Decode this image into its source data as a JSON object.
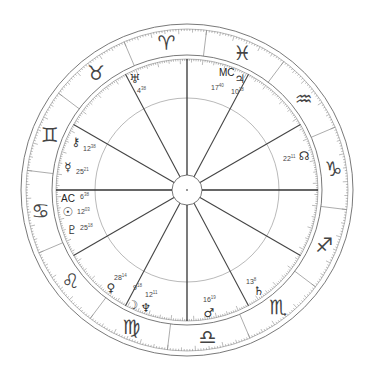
{
  "chart": {
    "center": [
      187,
      190
    ],
    "radii": {
      "outer": 166,
      "outer_inner": 161,
      "zodiac_inner": 135,
      "zodiac_inner2": 131,
      "middle": 92,
      "hub": 15
    },
    "sign_boundary_start_deg": 83,
    "house_spokes_deg": [
      0,
      30,
      62,
      90,
      118,
      150,
      180,
      210,
      242,
      270,
      298,
      330
    ],
    "axis_spokes_deg": [
      0,
      90,
      180,
      270
    ],
    "signs": [
      {
        "name": "aries",
        "glyph": "♈",
        "angle": 98
      },
      {
        "name": "taurus",
        "glyph": "♉",
        "angle": 128
      },
      {
        "name": "gemini",
        "glyph": "♊",
        "angle": 158
      },
      {
        "name": "cancer",
        "glyph": "♋",
        "angle": 188
      },
      {
        "name": "leo",
        "glyph": "♌",
        "angle": 218
      },
      {
        "name": "virgo",
        "glyph": "♍",
        "angle": 248
      },
      {
        "name": "libra",
        "glyph": "♎",
        "angle": 278
      },
      {
        "name": "scorpio",
        "glyph": "♏",
        "angle": 308
      },
      {
        "name": "sagittarius",
        "glyph": "♐",
        "angle": 338
      },
      {
        "name": "capricorn",
        "glyph": "♑",
        "angle": 8
      },
      {
        "name": "aquarius",
        "glyph": "♒",
        "angle": 38
      },
      {
        "name": "pisces",
        "glyph": "♓",
        "angle": 68
      }
    ],
    "angles": [
      {
        "name": "mc",
        "label": "MC",
        "x": 219,
        "y": 76,
        "deg": "17",
        "min": "40",
        "dx": 219,
        "dy": 88
      },
      {
        "name": "ac",
        "label": "AC",
        "x": 61,
        "y": 202,
        "deg": "6",
        "min": "38",
        "dx": 80,
        "dy": 201
      }
    ],
    "planets": [
      {
        "name": "uranus",
        "glyph": "♅",
        "x": 135,
        "y": 79,
        "deg": "4",
        "min": "38",
        "lx": 137,
        "ly": 93
      },
      {
        "name": "jupiter",
        "glyph": "♃",
        "x": 240,
        "y": 79,
        "deg": "10",
        "min": "18",
        "lx": 231,
        "ly": 94
      },
      {
        "name": "chiron",
        "glyph": "⚷",
        "x": 76,
        "y": 142,
        "deg": "12",
        "min": "38",
        "lx": 83,
        "ly": 151
      },
      {
        "name": "mercury",
        "glyph": "☿",
        "x": 68,
        "y": 167,
        "deg": "25",
        "min": "21",
        "lx": 76,
        "ly": 174
      },
      {
        "name": "node",
        "glyph": "☊",
        "x": 304,
        "y": 156,
        "deg": "22",
        "min": "11",
        "lx": 283,
        "ly": 161
      },
      {
        "name": "sun",
        "glyph": "☉",
        "x": 68,
        "y": 212,
        "deg": "12",
        "min": "03",
        "lx": 77,
        "ly": 214
      },
      {
        "name": "pluto",
        "glyph": "♇",
        "x": 72,
        "y": 230,
        "deg": "25",
        "min": "18",
        "lx": 80,
        "ly": 230
      },
      {
        "name": "venus",
        "glyph": "♀",
        "x": 111,
        "y": 288,
        "deg": "28",
        "min": "14",
        "lx": 114,
        "ly": 280
      },
      {
        "name": "moon",
        "glyph": "☽",
        "x": 133,
        "y": 305,
        "deg": "9",
        "min": "18",
        "lx": 133,
        "ly": 290
      },
      {
        "name": "neptune",
        "glyph": "♆",
        "x": 146,
        "y": 308,
        "deg": "12",
        "min": "11",
        "lx": 145,
        "ly": 297
      },
      {
        "name": "saturn",
        "glyph": "♄",
        "x": 259,
        "y": 291,
        "deg": "13",
        "min": "8",
        "lx": 246,
        "ly": 284
      },
      {
        "name": "mars",
        "glyph": "♂",
        "x": 209,
        "y": 313,
        "deg": "16",
        "min": "19",
        "lx": 203,
        "ly": 302
      }
    ]
  }
}
